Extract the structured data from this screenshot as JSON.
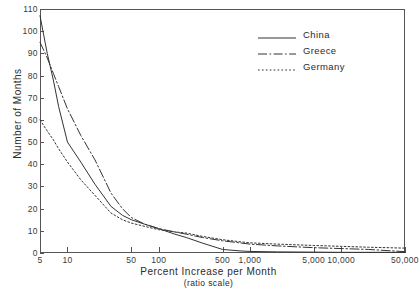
{
  "chart_data": {
    "type": "line",
    "title": "",
    "xlabel": "Percent Increase per Month",
    "xlabel_sub": "(ratio scale)",
    "ylabel": "Number of Months",
    "xscale": "log",
    "yscale": "linear",
    "xlim": [
      5,
      50000
    ],
    "ylim": [
      0,
      110
    ],
    "grid": false,
    "legend_position": "top-right",
    "xticks": [
      5,
      10,
      50,
      100,
      500,
      1000,
      5000,
      10000,
      50000
    ],
    "xtick_labels": [
      "5",
      "10",
      "50",
      "100",
      "500",
      "1,000",
      "5,000",
      "10,000",
      "50,000"
    ],
    "yticks": [
      0,
      10,
      20,
      30,
      40,
      50,
      60,
      70,
      80,
      90,
      100,
      110
    ],
    "ytick_labels": [
      "0",
      "10",
      "20",
      "30",
      "40",
      "50",
      "60",
      "70",
      "80",
      "90",
      "100",
      "110"
    ],
    "series": [
      {
        "name": "China",
        "style": "solid",
        "color": "#333333",
        "x": [
          5,
          6,
          7,
          8,
          10,
          14,
          20,
          30,
          40,
          50,
          70,
          100,
          150,
          200,
          300,
          500,
          800,
          1000,
          2000,
          5000,
          10000,
          50000
        ],
        "y": [
          107,
          90,
          78,
          66,
          50,
          41,
          31,
          21,
          17,
          15,
          13,
          11,
          8.5,
          7,
          4.5,
          1.6,
          0.9,
          0.7,
          0.5,
          0.4,
          0.3,
          0.3
        ]
      },
      {
        "name": "Greece",
        "style": "dashdot",
        "color": "#333333",
        "x": [
          5,
          6,
          7,
          8,
          10,
          14,
          20,
          30,
          40,
          50,
          70,
          100,
          150,
          200,
          300,
          500,
          800,
          1000,
          2000,
          5000,
          10000,
          20000,
          50000
        ],
        "y": [
          95,
          88,
          81,
          75,
          65,
          53,
          42,
          27,
          20,
          16,
          13,
          11,
          9.5,
          8.5,
          7,
          5.5,
          4.5,
          4,
          3.2,
          2.4,
          2,
          1.6,
          0.6
        ]
      },
      {
        "name": "Germany",
        "style": "dotted",
        "color": "#333333",
        "x": [
          5,
          6,
          7,
          8,
          10,
          14,
          20,
          30,
          40,
          50,
          70,
          100,
          150,
          200,
          300,
          500,
          800,
          1000,
          2000,
          5000,
          10000,
          20000,
          50000
        ],
        "y": [
          60,
          55,
          51,
          47,
          41,
          33,
          26,
          18,
          15,
          13.5,
          12,
          10.5,
          9.5,
          9,
          7.5,
          6,
          5,
          4.6,
          4,
          3.4,
          3,
          2.6,
          2.2
        ]
      }
    ]
  }
}
